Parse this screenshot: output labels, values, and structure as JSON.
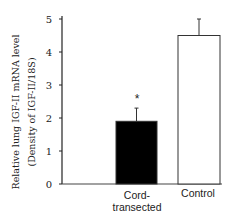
{
  "chart_data": {
    "type": "bar",
    "title": "",
    "xlabel": "",
    "ylabel": "Relative lung IGF-II mRNA level",
    "ylabel_line2": "(Density of IGF-II/18S)",
    "categories": [
      "Cord-transected",
      "Control"
    ],
    "category_lines": [
      [
        "Cord-",
        "transected"
      ],
      [
        "Control"
      ]
    ],
    "values": [
      1.9,
      4.5
    ],
    "error_upper": [
      0.4,
      0.5
    ],
    "annotations": [
      {
        "category": "Cord-transected",
        "text": "*",
        "meaning": "significant difference"
      }
    ],
    "bar_fill_colors": [
      "#000000",
      "#ffffff"
    ],
    "bar_edge_color": "#333333",
    "ylim": [
      0,
      5
    ],
    "yticks": [
      0,
      1,
      2,
      3,
      4,
      5
    ],
    "grid": false,
    "legend": null
  },
  "labels": {
    "ylabel_line1": "Relative lung IGF-II mRNA level",
    "ylabel_line2": "(Density of IGF-II/18S)",
    "cat0_line1": "Cord-",
    "cat0_line2": "transected",
    "cat1_line1": "Control",
    "asterisk": "*",
    "tick0": "0",
    "tick1": "1",
    "tick2": "2",
    "tick3": "3",
    "tick4": "4",
    "tick5": "5"
  }
}
